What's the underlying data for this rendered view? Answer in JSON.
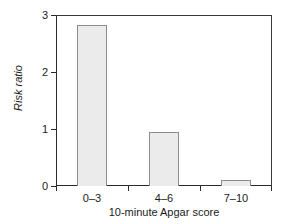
{
  "chart_data": {
    "type": "bar",
    "title": "",
    "subtitle": "",
    "categories": [
      "0–3",
      "4–6",
      "7–10"
    ],
    "values": [
      2.82,
      0.95,
      0.1
    ],
    "xlabel": "10-minute Apgar score",
    "ylabel": "Risk ratio",
    "ylim": [
      0,
      3
    ],
    "ytick_labels": [
      "0",
      "1",
      "2",
      "3"
    ],
    "ytick_values": [
      0,
      1,
      2,
      3
    ],
    "xtick_labels": [
      "0–3",
      "4–6",
      "7–10"
    ],
    "grid": false,
    "legend": null,
    "legend_position": "none",
    "annotations": [],
    "bar_fill_color": "#ebebeb",
    "bar_border_color": "#8c8c8c",
    "axis_color": "#2b2b2b",
    "background_color": "#ffffff",
    "ylabel_style": "italic"
  }
}
